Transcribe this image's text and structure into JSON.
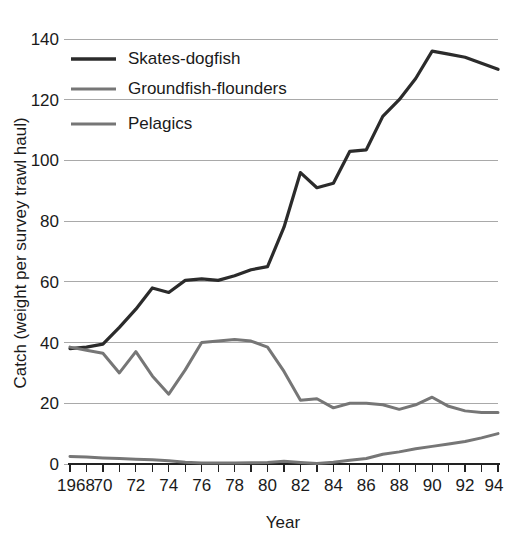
{
  "chart_data": {
    "type": "line",
    "title": "",
    "xlabel": "Year",
    "ylabel": "Catch (weight per survey trawl haul)",
    "xlim": [
      1968,
      1994
    ],
    "ylim": [
      0,
      140
    ],
    "grid": true,
    "legend_position": "top-left",
    "x_tick_labels": [
      "1968",
      "70",
      "72",
      "74",
      "76",
      "78",
      "80",
      "82",
      "84",
      "86",
      "88",
      "90",
      "92",
      "94"
    ],
    "x_tick_values": [
      1968,
      1970,
      1972,
      1974,
      1976,
      1978,
      1980,
      1982,
      1984,
      1986,
      1988,
      1990,
      1992,
      1994
    ],
    "x_minor_tick_values": [
      1969,
      1971,
      1973,
      1975,
      1977,
      1979,
      1981,
      1983,
      1985,
      1987,
      1989,
      1991,
      1993
    ],
    "y_tick_labels": [
      "0",
      "20",
      "40",
      "60",
      "80",
      "100",
      "120",
      "140"
    ],
    "y_tick_values": [
      0,
      20,
      40,
      60,
      80,
      100,
      120,
      140
    ],
    "x": [
      1968,
      1969,
      1970,
      1971,
      1972,
      1973,
      1974,
      1975,
      1976,
      1977,
      1978,
      1979,
      1980,
      1981,
      1982,
      1983,
      1984,
      1985,
      1986,
      1987,
      1988,
      1989,
      1990,
      1991,
      1992,
      1993,
      1994
    ],
    "series": [
      {
        "name": "Skates-dogfish",
        "color": "#2b2b2b",
        "width": 3.2,
        "values": [
          38,
          38.5,
          39.5,
          45,
          51,
          58,
          56.5,
          60.5,
          61,
          60.5,
          62,
          64,
          65,
          78,
          96,
          91,
          92.5,
          103,
          103.5,
          114.5,
          120,
          127,
          136,
          135,
          134,
          132,
          130
        ]
      },
      {
        "name": "Groundfish-flounders",
        "color": "#767676",
        "width": 3.0,
        "values": [
          38.5,
          37.5,
          36.5,
          30,
          37,
          29,
          23,
          31,
          40,
          40.5,
          41,
          40.5,
          38.5,
          30.5,
          21,
          21.5,
          18.5,
          20,
          20,
          19.5,
          18,
          19.5,
          22,
          19,
          17.5,
          17,
          17
        ]
      },
      {
        "name": "Pelagics",
        "color": "#767676",
        "width": 3.0,
        "values": [
          2.5,
          2.3,
          2.0,
          1.8,
          1.6,
          1.4,
          1.1,
          0.6,
          0.3,
          0.3,
          0.3,
          0.4,
          0.5,
          0.9,
          0.5,
          0.2,
          0.6,
          1.2,
          1.8,
          3.2,
          4.0,
          5.0,
          5.8,
          6.6,
          7.4,
          8.6,
          10.0
        ]
      }
    ]
  },
  "legend": {
    "entries": [
      {
        "label": "Skates-dogfish",
        "color": "#2b2b2b",
        "width": 3.4
      },
      {
        "label": "Groundfish-flounders",
        "color": "#767676",
        "width": 3.0
      },
      {
        "label": "Pelagics",
        "color": "#767676",
        "width": 3.0
      }
    ]
  }
}
